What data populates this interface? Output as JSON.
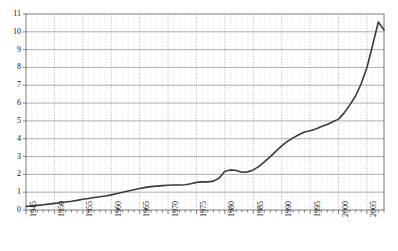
{
  "chart_data": {
    "type": "line",
    "title": "",
    "xlabel": "",
    "ylabel": "",
    "xlim": [
      1945,
      2008
    ],
    "ylim": [
      0,
      11
    ],
    "grid": true,
    "legend": "none",
    "ytick_labels": [
      "0",
      "1",
      "2",
      "3",
      "4",
      "5",
      "6",
      "7",
      "8",
      "9",
      "10",
      "11"
    ],
    "ytick_values": [
      0,
      1,
      2,
      3,
      4,
      5,
      6,
      7,
      8,
      9,
      10,
      11
    ],
    "xtick_labels": [
      "1945",
      "1950",
      "1955",
      "1960",
      "1965",
      "1970",
      "1975",
      "1980",
      "1985",
      "1990",
      "1995",
      "2000",
      "2005"
    ],
    "xtick_values": [
      1945,
      1950,
      1955,
      1960,
      1965,
      1970,
      1975,
      1980,
      1985,
      1990,
      1995,
      2000,
      2005
    ],
    "x_minor_step": 1,
    "series": [
      {
        "name": "series-1",
        "color": "#3a3a3a",
        "x": [
          1945,
          1946,
          1947,
          1948,
          1949,
          1950,
          1951,
          1952,
          1953,
          1954,
          1955,
          1956,
          1957,
          1958,
          1959,
          1960,
          1961,
          1962,
          1963,
          1964,
          1965,
          1966,
          1967,
          1968,
          1969,
          1970,
          1971,
          1972,
          1973,
          1974,
          1975,
          1976,
          1977,
          1978,
          1979,
          1980,
          1981,
          1982,
          1983,
          1984,
          1985,
          1986,
          1987,
          1988,
          1989,
          1990,
          1991,
          1992,
          1993,
          1994,
          1995,
          1996,
          1997,
          1998,
          1999,
          2000,
          2001,
          2002,
          2003,
          2004,
          2005,
          2006,
          2007,
          2008
        ],
        "values": [
          0.2,
          0.23,
          0.26,
          0.29,
          0.33,
          0.37,
          0.41,
          0.45,
          0.49,
          0.54,
          0.6,
          0.65,
          0.7,
          0.74,
          0.79,
          0.85,
          0.93,
          1.0,
          1.07,
          1.14,
          1.21,
          1.27,
          1.31,
          1.34,
          1.37,
          1.39,
          1.4,
          1.4,
          1.42,
          1.47,
          1.55,
          1.58,
          1.58,
          1.62,
          1.8,
          2.18,
          2.25,
          2.22,
          2.12,
          2.14,
          2.25,
          2.45,
          2.72,
          3.0,
          3.3,
          3.6,
          3.85,
          4.05,
          4.22,
          4.38,
          4.45,
          4.55,
          4.68,
          4.8,
          4.95,
          5.1,
          5.45,
          5.9,
          6.4,
          7.1,
          8.0,
          9.25,
          10.55,
          10.1
        ]
      }
    ]
  },
  "axis": {
    "y_title": "",
    "x_title": ""
  }
}
